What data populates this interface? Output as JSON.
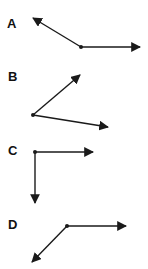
{
  "options": [
    {
      "label": "A",
      "label_pos": [
        7,
        17
      ],
      "vertex": [
        81,
        47
      ],
      "rays": [
        [
          33,
          18
        ],
        [
          140,
          47
        ]
      ]
    },
    {
      "label": "B",
      "label_pos": [
        8,
        70
      ],
      "vertex": [
        33,
        115
      ],
      "rays": [
        [
          80,
          75
        ],
        [
          108,
          127
        ]
      ]
    },
    {
      "label": "C",
      "label_pos": [
        8,
        144
      ],
      "vertex": [
        35,
        152
      ],
      "rays": [
        [
          93,
          152
        ],
        [
          35,
          203
        ]
      ]
    },
    {
      "label": "D",
      "label_pos": [
        8,
        218
      ],
      "vertex": [
        67,
        226
      ],
      "rays": [
        [
          126,
          226
        ],
        [
          32,
          262
        ]
      ]
    }
  ],
  "colors": {
    "stroke": "#1a1a1a",
    "background": "#ffffff"
  }
}
